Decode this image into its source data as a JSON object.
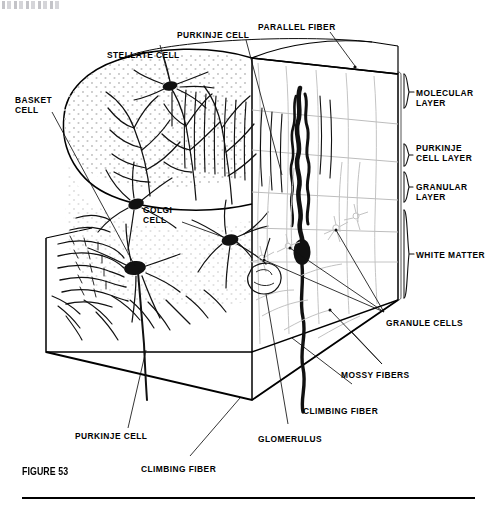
{
  "figure": {
    "number_label": "FIGURE 53",
    "artifact_text": ""
  },
  "labels": {
    "stellate_cell": "STELLATE CELL",
    "purkinje_cell_top": "PURKINJE CELL",
    "parallel_fiber": "PARALLEL FIBER",
    "basket_cell": "BASKET\nCELL",
    "golgi_cell": "GOLGI\nCELL",
    "molecular_layer": "MOLECULAR\nLAYER",
    "purkinje_cell_layer": "PURKINJE\nCELL LAYER",
    "granular_layer": "GRANULAR\nLAYER",
    "white_matter": "WHITE MATTER",
    "granule_cells": "GRANULE CELLS",
    "mossy_fibers": "MOSSY FIBERS",
    "climbing_fiber_right": "CLIMBING FIBER",
    "glomerulus": "GLOMERULUS",
    "climbing_fiber_bottom": "CLIMBING FIBER",
    "purkinje_cell_bottom": "PURKINJE CELL"
  },
  "layers": [
    {
      "name": "MOLECULAR LAYER"
    },
    {
      "name": "PURKINJE CELL LAYER"
    },
    {
      "name": "GRANULAR LAYER"
    },
    {
      "name": "WHITE MATTER"
    }
  ],
  "cell_types": [
    "STELLATE CELL",
    "BASKET CELL",
    "PURKINJE CELL",
    "GOLGI CELL",
    "GRANULE CELLS"
  ],
  "fiber_types": [
    "PARALLEL FIBER",
    "CLIMBING FIBER",
    "MOSSY FIBERS"
  ],
  "structures": [
    "GLOMERULUS"
  ],
  "colors": {
    "ink": "#000000",
    "paper": "#ffffff",
    "faint_ink": "#b9b9b9",
    "stipple": "#c9c9c9"
  }
}
